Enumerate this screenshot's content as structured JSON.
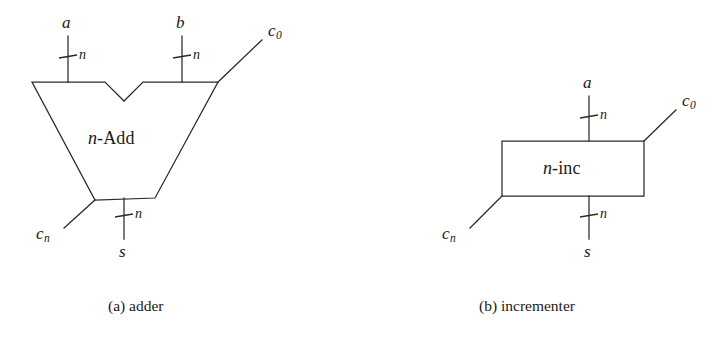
{
  "figure": {
    "background_color": "#ffffff",
    "ink_color": "#2b2b2b"
  },
  "panels": [
    {
      "id": "adder",
      "caption": "(a)  adder",
      "block_label_prefix": "n",
      "block_label_suffix": "-Add",
      "shape": "trapezoid-with-notch",
      "ports": {
        "input_a": "a",
        "input_b": "b",
        "carry_out": "c",
        "carry_out_sub": "0",
        "carry_in": "c",
        "carry_in_sub": "n",
        "sum": "s"
      },
      "bus_widths": {
        "a": "n",
        "b": "n",
        "s": "n"
      }
    },
    {
      "id": "incrementer",
      "caption": "(b)  incrementer",
      "block_label_prefix": "n",
      "block_label_suffix": "-inc",
      "shape": "rectangle",
      "ports": {
        "input_a": "a",
        "carry_out": "c",
        "carry_out_sub": "0",
        "carry_in": "c",
        "carry_in_sub": "n",
        "sum": "s"
      },
      "bus_widths": {
        "a": "n",
        "s": "n"
      }
    }
  ]
}
